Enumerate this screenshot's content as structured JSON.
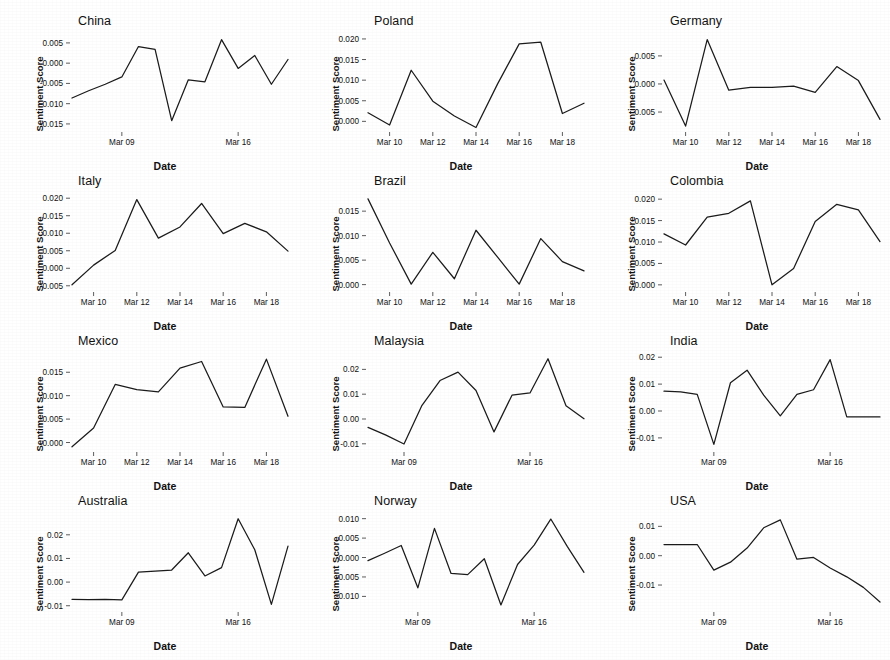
{
  "figure": {
    "title": "",
    "axis_labels": {
      "x": "Date",
      "y": "Sentiment Score"
    },
    "grid": false,
    "layout": {
      "rows": 4,
      "cols": 3
    },
    "line_color": "#1b1b1b",
    "background": "#ffffff"
  },
  "chart_data": [
    {
      "type": "line",
      "title": "China",
      "xlabel": "Date",
      "ylabel": "Sentiment Score",
      "xticklabels": [
        "Mar 09",
        "Mar 16"
      ],
      "xtickdates": [
        "2020-03-09",
        "2020-03-16"
      ],
      "yticklabels": [
        "0.005",
        "0.000",
        "-0.005",
        "-0.010",
        "-0.015"
      ],
      "ytickvalues": [
        0.005,
        0.0,
        -0.005,
        -0.01,
        -0.015
      ],
      "ylim": [
        -0.0165,
        0.0072
      ],
      "xlim": [
        "2020-03-06",
        "2020-03-19"
      ],
      "x": [
        "2020-03-06",
        "2020-03-07",
        "2020-03-08",
        "2020-03-09",
        "2020-03-10",
        "2020-03-11",
        "2020-03-12",
        "2020-03-13",
        "2020-03-14",
        "2020-03-15",
        "2020-03-16",
        "2020-03-17",
        "2020-03-18",
        "2020-03-19"
      ],
      "values": [
        -0.0086,
        -0.0068,
        -0.0052,
        -0.0034,
        0.0041,
        0.0034,
        -0.0142,
        -0.0041,
        -0.0046,
        0.0058,
        -0.0013,
        0.0019,
        -0.0052,
        0.0009
      ]
    },
    {
      "type": "line",
      "title": "Poland",
      "xlabel": "Date",
      "ylabel": "Sentiment Score",
      "xticklabels": [
        "Mar 10",
        "Mar 12",
        "Mar 14",
        "Mar 16",
        "Mar 18"
      ],
      "xtickdates": [
        "2020-03-10",
        "2020-03-12",
        "2020-03-14",
        "2020-03-16",
        "2020-03-18"
      ],
      "yticklabels": [
        "0.020",
        "0.015",
        "0.010",
        "0.005",
        "0.000"
      ],
      "ytickvalues": [
        0.02,
        0.015,
        0.01,
        0.005,
        0.0
      ],
      "ylim": [
        -0.0021,
        0.0212
      ],
      "xlim": [
        "2020-03-09",
        "2020-03-19"
      ],
      "x": [
        "2020-03-09",
        "2020-03-10",
        "2020-03-11",
        "2020-03-12",
        "2020-03-13",
        "2020-03-14",
        "2020-03-15",
        "2020-03-16",
        "2020-03-17",
        "2020-03-18",
        "2020-03-19"
      ],
      "values": [
        0.0021,
        -0.0009,
        0.0124,
        0.0049,
        0.0013,
        -0.0015,
        0.0091,
        0.0188,
        0.0192,
        0.0019,
        0.0044
      ]
    },
    {
      "type": "line",
      "title": "Germany",
      "xlabel": "Date",
      "ylabel": "Sentiment Score",
      "xticklabels": [
        "Mar 10",
        "Mar 12",
        "Mar 14",
        "Mar 16",
        "Mar 18"
      ],
      "xtickdates": [
        "2020-03-10",
        "2020-03-12",
        "2020-03-14",
        "2020-03-16",
        "2020-03-18"
      ],
      "yticklabels": [
        "0.005",
        "0.000",
        "-0.005"
      ],
      "ytickvalues": [
        0.005,
        0.0,
        -0.005
      ],
      "ylim": [
        -0.0082,
        0.0089
      ],
      "xlim": [
        "2020-03-09",
        "2020-03-19"
      ],
      "x": [
        "2020-03-09",
        "2020-03-10",
        "2020-03-11",
        "2020-03-12",
        "2020-03-13",
        "2020-03-14",
        "2020-03-15",
        "2020-03-16",
        "2020-03-17",
        "2020-03-18",
        "2020-03-19"
      ],
      "values": [
        0.0007,
        -0.0075,
        0.0079,
        -0.0011,
        -0.0006,
        -0.0006,
        -0.0004,
        -0.0015,
        0.0031,
        0.0006,
        -0.0063
      ]
    },
    {
      "type": "line",
      "title": "Italy",
      "xlabel": "Date",
      "ylabel": "Sentiment Score",
      "xticklabels": [
        "Mar 10",
        "Mar 12",
        "Mar 14",
        "Mar 16",
        "Mar 18"
      ],
      "xtickdates": [
        "2020-03-10",
        "2020-03-12",
        "2020-03-14",
        "2020-03-16",
        "2020-03-18"
      ],
      "yticklabels": [
        "0.020",
        "0.015",
        "0.010",
        "0.005",
        "0.000",
        "-0.005"
      ],
      "ytickvalues": [
        0.02,
        0.015,
        0.01,
        0.005,
        0.0,
        -0.005
      ],
      "ylim": [
        -0.0062,
        0.0212
      ],
      "xlim": [
        "2020-03-09",
        "2020-03-19"
      ],
      "x": [
        "2020-03-09",
        "2020-03-10",
        "2020-03-11",
        "2020-03-12",
        "2020-03-13",
        "2020-03-14",
        "2020-03-15",
        "2020-03-16",
        "2020-03-17",
        "2020-03-18",
        "2020-03-19"
      ],
      "values": [
        -0.0047,
        0.0009,
        0.0051,
        0.0196,
        0.0086,
        0.0118,
        0.0185,
        0.0099,
        0.0128,
        0.0104,
        0.0049
      ]
    },
    {
      "type": "line",
      "title": "Brazil",
      "xlabel": "Date",
      "ylabel": "Sentiment Score",
      "xticklabels": [
        "Mar 10",
        "Mar 12",
        "Mar 14",
        "Mar 16",
        "Mar 18"
      ],
      "xtickdates": [
        "2020-03-10",
        "2020-03-12",
        "2020-03-14",
        "2020-03-16",
        "2020-03-18"
      ],
      "yticklabels": [
        "0.015",
        "0.010",
        "0.005",
        "0.000"
      ],
      "ytickvalues": [
        0.015,
        0.01,
        0.005,
        0.0
      ],
      "ylim": [
        -0.0011,
        0.0185
      ],
      "xlim": [
        "2020-03-09",
        "2020-03-19"
      ],
      "x": [
        "2020-03-09",
        "2020-03-10",
        "2020-03-11",
        "2020-03-12",
        "2020-03-13",
        "2020-03-14",
        "2020-03-15",
        "2020-03-16",
        "2020-03-17",
        "2020-03-18",
        "2020-03-19"
      ],
      "values": [
        0.0175,
        0.0085,
        0.0001,
        0.0066,
        0.0012,
        0.0111,
        0.0056,
        0.0001,
        0.0094,
        0.0047,
        0.0028
      ]
    },
    {
      "type": "line",
      "title": "Colombia",
      "xlabel": "Date",
      "ylabel": "Sentiment Score",
      "xticklabels": [
        "Mar 10",
        "Mar 12",
        "Mar 14",
        "Mar 16",
        "Mar 18"
      ],
      "xtickdates": [
        "2020-03-10",
        "2020-03-12",
        "2020-03-14",
        "2020-03-16",
        "2020-03-18"
      ],
      "yticklabels": [
        "0.020",
        "0.015",
        "0.010",
        "0.005",
        "0.000"
      ],
      "ytickvalues": [
        0.02,
        0.015,
        0.01,
        0.005,
        0.0
      ],
      "ylim": [
        -0.0012,
        0.0212
      ],
      "xlim": [
        "2020-03-09",
        "2020-03-19"
      ],
      "x": [
        "2020-03-09",
        "2020-03-10",
        "2020-03-11",
        "2020-03-12",
        "2020-03-13",
        "2020-03-14",
        "2020-03-15",
        "2020-03-16",
        "2020-03-17",
        "2020-03-18",
        "2020-03-19"
      ],
      "values": [
        0.0119,
        0.0093,
        0.0158,
        0.0167,
        0.0196,
        0.0,
        0.0038,
        0.0148,
        0.0188,
        0.0175,
        0.0101
      ]
    },
    {
      "type": "line",
      "title": "Mexico",
      "xlabel": "Date",
      "ylabel": "Sentiment Score",
      "xticklabels": [
        "Mar 10",
        "Mar 12",
        "Mar 14",
        "Mar 16",
        "Mar 18"
      ],
      "xtickdates": [
        "2020-03-10",
        "2020-03-12",
        "2020-03-14",
        "2020-03-16",
        "2020-03-18"
      ],
      "yticklabels": [
        "0.015",
        "0.010",
        "0.005",
        "0.000"
      ],
      "ytickvalues": [
        0.015,
        0.01,
        0.005,
        0.0
      ],
      "ylim": [
        -0.0016,
        0.0189
      ],
      "xlim": [
        "2020-03-09",
        "2020-03-19"
      ],
      "x": [
        "2020-03-09",
        "2020-03-10",
        "2020-03-11",
        "2020-03-12",
        "2020-03-13",
        "2020-03-14",
        "2020-03-15",
        "2020-03-16",
        "2020-03-17",
        "2020-03-18",
        "2020-03-19"
      ],
      "values": [
        -0.0009,
        0.0031,
        0.0124,
        0.0113,
        0.0108,
        0.0159,
        0.0173,
        0.0076,
        0.0075,
        0.0178,
        0.0056
      ]
    },
    {
      "type": "line",
      "title": "Malaysia",
      "xlabel": "Date",
      "ylabel": "Sentiment Score",
      "xticklabels": [
        "Mar 09",
        "Mar 16"
      ],
      "xtickdates": [
        "2020-03-09",
        "2020-03-16"
      ],
      "yticklabels": [
        "0.02",
        "0.01",
        "0.00",
        "-0.01"
      ],
      "ytickvalues": [
        0.02,
        0.01,
        0.0,
        -0.01
      ],
      "ylim": [
        -0.0125,
        0.0262
      ],
      "xlim": [
        "2020-03-07",
        "2020-03-19"
      ],
      "x": [
        "2020-03-07",
        "2020-03-08",
        "2020-03-09",
        "2020-03-10",
        "2020-03-11",
        "2020-03-12",
        "2020-03-13",
        "2020-03-14",
        "2020-03-15",
        "2020-03-16",
        "2020-03-17",
        "2020-03-18",
        "2020-03-19"
      ],
      "values": [
        -0.0034,
        -0.0065,
        -0.0101,
        0.0055,
        0.0155,
        0.0189,
        0.0115,
        -0.0052,
        0.0096,
        0.0105,
        0.0243,
        0.0053,
        0.0001
      ]
    },
    {
      "type": "line",
      "title": "India",
      "xlabel": "Date",
      "ylabel": "Sentiment Score",
      "xticklabels": [
        "Mar 09",
        "Mar 16"
      ],
      "xtickdates": [
        "2020-03-09",
        "2020-03-16"
      ],
      "yticklabels": [
        "0.02",
        "0.01",
        "0.00",
        "-0.01"
      ],
      "ytickvalues": [
        0.02,
        0.01,
        0.0,
        -0.01
      ],
      "ylim": [
        -0.0145,
        0.0212
      ],
      "xlim": [
        "2020-03-06",
        "2020-03-19"
      ],
      "x": [
        "2020-03-06",
        "2020-03-07",
        "2020-03-08",
        "2020-03-09",
        "2020-03-10",
        "2020-03-11",
        "2020-03-12",
        "2020-03-13",
        "2020-03-14",
        "2020-03-15",
        "2020-03-16",
        "2020-03-17",
        "2020-03-18",
        "2020-03-19"
      ],
      "values": [
        0.0074,
        0.0071,
        0.0062,
        -0.0124,
        0.0105,
        0.0152,
        0.0059,
        -0.0018,
        0.0062,
        0.0079,
        0.0191,
        -0.0022,
        -0.0022,
        -0.0022
      ]
    },
    {
      "type": "line",
      "title": "Australia",
      "xlabel": "Date",
      "ylabel": "Sentiment Score",
      "xticklabels": [
        "Mar 09",
        "Mar 16"
      ],
      "xtickdates": [
        "2020-03-09",
        "2020-03-16"
      ],
      "yticklabels": [
        "0.02",
        "0.01",
        "0.00",
        "-0.01"
      ],
      "ytickvalues": [
        0.02,
        0.01,
        0.0,
        -0.01
      ],
      "ylim": [
        -0.0118,
        0.0288
      ],
      "xlim": [
        "2020-03-06",
        "2020-03-19"
      ],
      "x": [
        "2020-03-06",
        "2020-03-07",
        "2020-03-08",
        "2020-03-09",
        "2020-03-10",
        "2020-03-11",
        "2020-03-12",
        "2020-03-13",
        "2020-03-14",
        "2020-03-15",
        "2020-03-16",
        "2020-03-17",
        "2020-03-18",
        "2020-03-19"
      ],
      "values": [
        -0.0073,
        -0.0074,
        -0.0073,
        -0.0075,
        0.0042,
        0.0046,
        0.0051,
        0.0124,
        0.0026,
        0.0061,
        0.0268,
        0.0137,
        -0.0094,
        0.0152
      ]
    },
    {
      "type": "line",
      "title": "Norway",
      "xlabel": "Date",
      "ylabel": "Sentiment Score",
      "xticklabels": [
        "Mar 09",
        "Mar 16"
      ],
      "xtickdates": [
        "2020-03-09",
        "2020-03-16"
      ],
      "yticklabels": [
        "0.010",
        "0.005",
        "0.000",
        "-0.005",
        "-0.010"
      ],
      "ytickvalues": [
        0.01,
        0.005,
        0.0,
        -0.005,
        -0.01
      ],
      "ylim": [
        -0.0135,
        0.0112
      ],
      "xlim": [
        "2020-03-06",
        "2020-03-19"
      ],
      "x": [
        "2020-03-06",
        "2020-03-07",
        "2020-03-08",
        "2020-03-09",
        "2020-03-10",
        "2020-03-11",
        "2020-03-12",
        "2020-03-13",
        "2020-03-14",
        "2020-03-15",
        "2020-03-16",
        "2020-03-17",
        "2020-03-18",
        "2020-03-19"
      ],
      "values": [
        -0.0008,
        0.0011,
        0.0031,
        -0.0078,
        0.0075,
        -0.0041,
        -0.0044,
        -0.0003,
        -0.0122,
        -0.0018,
        0.0032,
        0.0099,
        0.0028,
        -0.0038
      ]
    },
    {
      "type": "line",
      "title": "USA",
      "xlabel": "Date",
      "ylabel": "Sentiment Score",
      "xticklabels": [
        "Mar 09",
        "Mar 16"
      ],
      "xtickdates": [
        "2020-03-09",
        "2020-03-16"
      ],
      "yticklabels": [
        "0.01",
        "0.00",
        "-0.01"
      ],
      "ytickvalues": [
        0.01,
        0.0,
        -0.01
      ],
      "ylim": [
        -0.0185,
        0.0142
      ],
      "xlim": [
        "2020-03-06",
        "2020-03-19"
      ],
      "x": [
        "2020-03-06",
        "2020-03-07",
        "2020-03-08",
        "2020-03-09",
        "2020-03-10",
        "2020-03-11",
        "2020-03-12",
        "2020-03-13",
        "2020-03-14",
        "2020-03-15",
        "2020-03-16",
        "2020-03-17",
        "2020-03-18",
        "2020-03-19"
      ],
      "values": [
        0.0038,
        0.0038,
        0.0038,
        -0.0049,
        -0.0022,
        0.0026,
        0.0095,
        0.0122,
        -0.0012,
        -0.0006,
        -0.0042,
        -0.0072,
        -0.0108,
        -0.0158
      ]
    }
  ]
}
